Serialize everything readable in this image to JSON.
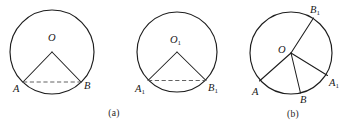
{
  "figure": {
    "background_color": "#ffffff",
    "stroke_color": "#1d1d1d",
    "dash_color": "#5a5a5a",
    "width": 357,
    "height": 127,
    "captions": [
      {
        "text": "(a)",
        "x": 114,
        "y": 116
      },
      {
        "text": "(b)",
        "x": 293,
        "y": 117
      }
    ],
    "panels": [
      {
        "id": "panel-a",
        "caption": "(a)",
        "circles": [
          {
            "id": "circle-left",
            "center_label": "O",
            "center_label_sub": "",
            "cx": 52,
            "cy": 52,
            "r": 42,
            "center_label_x": 48,
            "center_label_y": 41,
            "points": [
              {
                "label": "A",
                "sub": "",
                "x": 23.0,
                "y": 82.0,
                "label_x": 13,
                "label_y": 92
              },
              {
                "label": "B",
                "sub": "",
                "x": 81.0,
                "y": 82.0,
                "label_x": 84,
                "label_y": 89
              }
            ],
            "radii": [
              {
                "from": "O",
                "to": "A"
              },
              {
                "from": "O",
                "to": "B"
              }
            ],
            "chord": {
              "from": "A",
              "to": "B",
              "style": "dashed"
            }
          },
          {
            "id": "circle-middle",
            "center_label": "O",
            "center_label_sub": "1",
            "cx": 177,
            "cy": 52,
            "r": 40,
            "center_label_x": 170,
            "center_label_y": 43,
            "points": [
              {
                "label": "A",
                "sub": "1",
                "x": 148.0,
                "y": 80.5,
                "label_x": 135,
                "label_y": 92
              },
              {
                "label": "B",
                "sub": "1",
                "x": 206.0,
                "y": 80.5,
                "label_x": 208,
                "label_y": 91
              }
            ],
            "radii": [
              {
                "from": "O1",
                "to": "A1"
              },
              {
                "from": "O1",
                "to": "B1"
              }
            ],
            "chord": {
              "from": "A1",
              "to": "B1",
              "style": "dashed"
            }
          }
        ]
      },
      {
        "id": "panel-b",
        "caption": "(b)",
        "circles": [
          {
            "id": "circle-right",
            "center_label": "O",
            "center_label_sub": "",
            "cx": 291,
            "cy": 53,
            "r": 41,
            "center_label_x": 278,
            "center_label_y": 53,
            "points": [
              {
                "label": "A",
                "sub": "",
                "x": 259.5,
                "y": 81.0,
                "label_x": 252,
                "label_y": 95
              },
              {
                "label": "B",
                "sub": "",
                "x": 300.5,
                "y": 93.0,
                "label_x": 300,
                "label_y": 103
              },
              {
                "label": "A",
                "sub": "1",
                "x": 327.5,
                "y": 75.5,
                "label_x": 329,
                "label_y": 86
              },
              {
                "label": "B",
                "sub": "1",
                "x": 313.5,
                "y": 18.0,
                "label_x": 310,
                "label_y": 13
              }
            ],
            "radii": [
              {
                "from": "O",
                "to": "A"
              },
              {
                "from": "O",
                "to": "B"
              },
              {
                "from": "O",
                "to": "A1"
              },
              {
                "from": "O",
                "to": "B1"
              }
            ],
            "chord": null
          }
        ]
      }
    ]
  }
}
